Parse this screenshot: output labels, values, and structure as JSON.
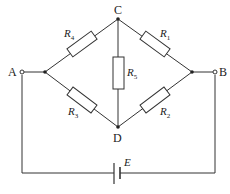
{
  "diagram": {
    "type": "Wheatstone bridge circuit",
    "nodes": {
      "A": "A",
      "B": "B",
      "C": "C",
      "D": "D"
    },
    "resistors": [
      {
        "id": "R1",
        "letter": "R",
        "sub": "1",
        "between": "C-right node"
      },
      {
        "id": "R2",
        "letter": "R",
        "sub": "2",
        "between": "right node-D"
      },
      {
        "id": "R3",
        "letter": "R",
        "sub": "3",
        "between": "left node-D"
      },
      {
        "id": "R4",
        "letter": "R",
        "sub": "4",
        "between": "left node-C"
      },
      {
        "id": "R5",
        "letter": "R",
        "sub": "5",
        "between": "C-D"
      }
    ],
    "source": {
      "label": "E",
      "between": "A-B"
    },
    "colors": {
      "line": "#333333",
      "background": "#ffffff"
    }
  }
}
